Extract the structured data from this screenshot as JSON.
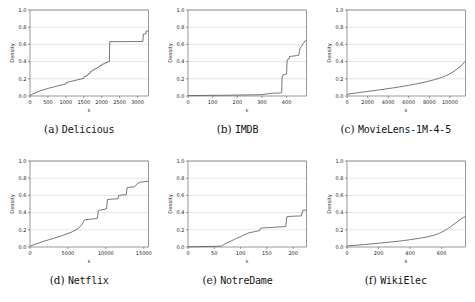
{
  "figure": {
    "background": "#ffffff",
    "line_color": "#4a4a4a",
    "grid_color": "#c8c8c8",
    "frame_color": "#555555"
  },
  "chart_data": [
    {
      "type": "line",
      "panel_label": "(a)",
      "dataset": "Delicious",
      "caption": "(a) Delicious",
      "title": "",
      "xlabel": "k",
      "ylabel": "Density",
      "xlim": [
        0,
        3300
      ],
      "ylim": [
        0.0,
        1.0
      ],
      "xticks": [
        0,
        500,
        1000,
        1500,
        2000,
        2500,
        3000
      ],
      "yticks": [
        0.0,
        0.2,
        0.4,
        0.6,
        0.8,
        1.0
      ],
      "ytick_labels": [
        "0.0",
        "0.2",
        "0.4",
        "0.6",
        "0.8",
        "1.0"
      ],
      "grid": true,
      "legend": "none",
      "x": [
        0,
        60,
        140,
        250,
        380,
        520,
        660,
        800,
        940,
        1000,
        1010,
        1100,
        1200,
        1300,
        1400,
        1500,
        1510,
        1560,
        1570,
        1620,
        1630,
        1680,
        1690,
        1730,
        1740,
        1790,
        1800,
        1860,
        1870,
        1930,
        1940,
        2000,
        2010,
        2080,
        2090,
        2150,
        2160,
        2215,
        2225,
        2230,
        2600,
        3000,
        3150,
        3160,
        3230,
        3240,
        3300
      ],
      "y": [
        0.005,
        0.02,
        0.035,
        0.055,
        0.072,
        0.09,
        0.105,
        0.12,
        0.135,
        0.14,
        0.155,
        0.165,
        0.175,
        0.185,
        0.195,
        0.205,
        0.225,
        0.228,
        0.24,
        0.243,
        0.262,
        0.265,
        0.285,
        0.288,
        0.3,
        0.303,
        0.315,
        0.318,
        0.332,
        0.335,
        0.352,
        0.355,
        0.37,
        0.373,
        0.385,
        0.388,
        0.398,
        0.4,
        0.63,
        0.632,
        0.632,
        0.633,
        0.635,
        0.72,
        0.722,
        0.755,
        0.758
      ]
    },
    {
      "type": "line",
      "panel_label": "(b)",
      "dataset": "IMDB",
      "caption": "(b) IMDB",
      "title": "",
      "xlabel": "k",
      "ylabel": "Density",
      "xlim": [
        0,
        480
      ],
      "ylim": [
        0.0,
        1.0
      ],
      "xticks": [
        0,
        100,
        200,
        300,
        400
      ],
      "yticks": [
        0.0,
        0.2,
        0.4,
        0.6,
        0.8,
        1.0
      ],
      "ytick_labels": [
        "0.0",
        "0.2",
        "0.4",
        "0.6",
        "0.8",
        "1.0"
      ],
      "grid": true,
      "legend": "none",
      "x": [
        0,
        50,
        100,
        150,
        200,
        250,
        290,
        300,
        310,
        320,
        330,
        340,
        350,
        360,
        370,
        375,
        378,
        380,
        382,
        385,
        390,
        395,
        400,
        402,
        405,
        410,
        412,
        420,
        425,
        430,
        435,
        440,
        445,
        450,
        452,
        455,
        460,
        465,
        470,
        475,
        480
      ],
      "y": [
        0.004,
        0.006,
        0.008,
        0.009,
        0.011,
        0.013,
        0.015,
        0.017,
        0.02,
        0.024,
        0.028,
        0.031,
        0.033,
        0.034,
        0.035,
        0.036,
        0.037,
        0.038,
        0.21,
        0.245,
        0.25,
        0.252,
        0.255,
        0.42,
        0.425,
        0.43,
        0.46,
        0.462,
        0.463,
        0.465,
        0.468,
        0.47,
        0.472,
        0.474,
        0.52,
        0.555,
        0.575,
        0.6,
        0.62,
        0.64,
        0.645
      ]
    },
    {
      "type": "line",
      "panel_label": "(c)",
      "dataset": "MovieLens-1M-4-5",
      "caption": "(c) MovieLens-1M-4-5",
      "title": "",
      "xlabel": "k",
      "ylabel": "Density",
      "xlim": [
        0,
        11500
      ],
      "ylim": [
        0.0,
        1.0
      ],
      "xticks": [
        0,
        2000,
        4000,
        6000,
        8000,
        10000
      ],
      "yticks": [
        0.0,
        0.2,
        0.4,
        0.6,
        0.8,
        1.0
      ],
      "ytick_labels": [
        "0.0",
        "0.2",
        "0.4",
        "0.6",
        "0.8",
        "1.0"
      ],
      "grid": true,
      "legend": "none",
      "x": [
        0,
        500,
        1000,
        1500,
        2000,
        2500,
        3000,
        3500,
        4000,
        4500,
        5000,
        5500,
        6000,
        6500,
        7000,
        7500,
        8000,
        8500,
        9000,
        9300,
        9600,
        9900,
        10200,
        10500,
        10800,
        11000,
        11200,
        11350,
        11450,
        11500
      ],
      "y": [
        0.02,
        0.028,
        0.037,
        0.045,
        0.053,
        0.061,
        0.069,
        0.077,
        0.086,
        0.095,
        0.104,
        0.114,
        0.124,
        0.135,
        0.147,
        0.16,
        0.174,
        0.19,
        0.208,
        0.221,
        0.235,
        0.252,
        0.272,
        0.295,
        0.322,
        0.342,
        0.365,
        0.385,
        0.398,
        0.402
      ]
    },
    {
      "type": "line",
      "panel_label": "(d)",
      "dataset": "Netflix",
      "caption": "(d) Netflix",
      "title": "",
      "xlabel": "k",
      "ylabel": "Density",
      "xlim": [
        0,
        15600
      ],
      "ylim": [
        0.0,
        1.0
      ],
      "xticks": [
        0,
        5000,
        10000,
        15000
      ],
      "yticks": [
        0.0,
        0.2,
        0.4,
        0.6,
        0.8,
        1.0
      ],
      "ytick_labels": [
        "0.0",
        "0.2",
        "0.4",
        "0.6",
        "0.8",
        "1.0"
      ],
      "grid": true,
      "legend": "none",
      "x": [
        0,
        800,
        1600,
        2400,
        3200,
        4000,
        4800,
        5600,
        6200,
        6600,
        6900,
        7100,
        7200,
        7400,
        7800,
        8200,
        8600,
        8900,
        9000,
        9100,
        9300,
        9600,
        9900,
        10100,
        10200,
        10600,
        11000,
        11400,
        11600,
        11700,
        12000,
        12400,
        12700,
        12800,
        13000,
        13400,
        13800,
        14200,
        14600,
        15000,
        15300,
        15600
      ],
      "y": [
        0.01,
        0.035,
        0.06,
        0.082,
        0.103,
        0.125,
        0.15,
        0.178,
        0.205,
        0.235,
        0.27,
        0.3,
        0.315,
        0.318,
        0.322,
        0.325,
        0.33,
        0.335,
        0.42,
        0.425,
        0.43,
        0.435,
        0.44,
        0.445,
        0.55,
        0.555,
        0.558,
        0.56,
        0.562,
        0.6,
        0.603,
        0.606,
        0.608,
        0.69,
        0.693,
        0.697,
        0.7,
        0.74,
        0.755,
        0.758,
        0.762,
        0.765
      ]
    },
    {
      "type": "line",
      "panel_label": "(e)",
      "dataset": "NotreDame",
      "caption": "(e) NotreDame",
      "title": "",
      "xlabel": "k",
      "ylabel": "Density",
      "xlim": [
        0,
        225
      ],
      "ylim": [
        0.0,
        1.0
      ],
      "xticks": [
        0,
        50,
        100,
        150,
        200
      ],
      "yticks": [
        0.0,
        0.2,
        0.4,
        0.6,
        0.8,
        1.0
      ],
      "ytick_labels": [
        "0.0",
        "0.2",
        "0.4",
        "0.6",
        "0.8",
        "1.0"
      ],
      "grid": true,
      "legend": "none",
      "x": [
        0,
        20,
        40,
        55,
        62,
        64,
        66,
        70,
        74,
        78,
        82,
        86,
        90,
        94,
        98,
        102,
        106,
        110,
        113,
        116,
        120,
        124,
        128,
        132,
        136,
        138,
        140,
        145,
        150,
        160,
        170,
        180,
        186,
        188,
        190,
        200,
        210,
        216,
        218,
        222,
        225
      ],
      "y": [
        0.002,
        0.004,
        0.006,
        0.008,
        0.01,
        0.012,
        0.02,
        0.035,
        0.048,
        0.058,
        0.07,
        0.082,
        0.095,
        0.105,
        0.115,
        0.125,
        0.14,
        0.15,
        0.158,
        0.165,
        0.17,
        0.175,
        0.18,
        0.185,
        0.19,
        0.218,
        0.22,
        0.222,
        0.225,
        0.228,
        0.232,
        0.235,
        0.238,
        0.352,
        0.355,
        0.358,
        0.36,
        0.362,
        0.425,
        0.428,
        0.43
      ]
    },
    {
      "type": "line",
      "panel_label": "(f)",
      "dataset": "WikiElec",
      "caption": "(f) WikiElec",
      "title": "",
      "xlabel": "k",
      "ylabel": "Density",
      "xlim": [
        0,
        750
      ],
      "ylim": [
        0.0,
        1.0
      ],
      "xticks": [
        0,
        200,
        400,
        600
      ],
      "yticks": [
        0.0,
        0.2,
        0.4,
        0.6,
        0.8,
        1.0
      ],
      "ytick_labels": [
        "0.0",
        "0.2",
        "0.4",
        "0.6",
        "0.8",
        "1.0"
      ],
      "grid": true,
      "legend": "none",
      "x": [
        0,
        40,
        80,
        120,
        160,
        200,
        240,
        280,
        320,
        360,
        400,
        440,
        480,
        510,
        540,
        560,
        580,
        600,
        620,
        640,
        660,
        680,
        700,
        715,
        730,
        740,
        750
      ],
      "y": [
        0.012,
        0.018,
        0.024,
        0.03,
        0.037,
        0.044,
        0.051,
        0.058,
        0.066,
        0.075,
        0.085,
        0.096,
        0.108,
        0.118,
        0.132,
        0.142,
        0.155,
        0.172,
        0.192,
        0.215,
        0.24,
        0.268,
        0.295,
        0.315,
        0.335,
        0.345,
        0.35
      ]
    }
  ]
}
